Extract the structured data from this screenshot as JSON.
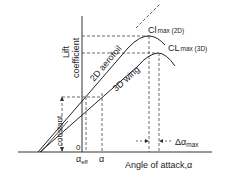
{
  "axes": {
    "y_label_line1": "Lift",
    "y_label_line2": "coefficient",
    "x_label": "Angle of attack,α",
    "origin": "0"
  },
  "curves": {
    "aerofoil_2d": "2D aerofoil",
    "wing_3d": "3D wing"
  },
  "annotations": {
    "cl_max_2d_main": "Cl",
    "cl_max_2d_sub": "max (2D)",
    "cl_max_3d_main": "CL",
    "cl_max_3d_sub": "max (3D)",
    "constant": "constant",
    "alpha_eff_main": "α",
    "alpha_eff_sub": "eff",
    "alpha": "α",
    "delta_alpha_main": "Δα",
    "delta_alpha_sub": "max"
  },
  "colors": {
    "line": "#222222",
    "dash": "#444444",
    "background": "#ffffff"
  }
}
